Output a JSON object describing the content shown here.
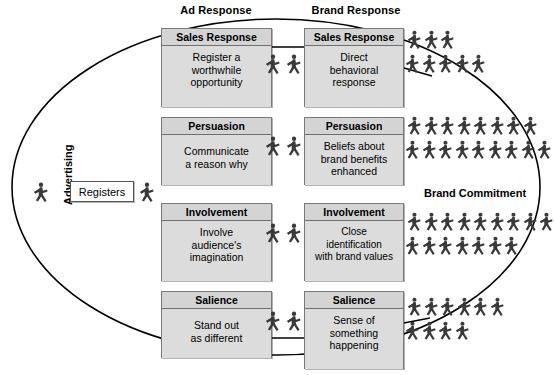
{
  "diagram": {
    "title_left_column": "Ad Response",
    "title_right_column": "Brand Response",
    "outer_label": "Advertising",
    "right_label": "Brand Commitment",
    "registers_label": "Registers",
    "figure_icon": "walking-person-icon",
    "colors": {
      "box_fill": "#dcdcdc",
      "box_header_fill": "#d4d4d4",
      "box_border": "#7a7a7a",
      "figure": "#3a3a3a",
      "line": "#000000",
      "background": "#ffffff"
    },
    "rows": [
      {
        "id": "sales-response",
        "ad": {
          "header": "Sales Response",
          "body": "Register a\nworthwhile\nopportunity"
        },
        "brand": {
          "header": "Sales Response",
          "body": "Direct\nbehavioral\nresponse"
        },
        "middle_figures": 2,
        "right_figures": [
          3,
          5
        ]
      },
      {
        "id": "persuasion",
        "ad": {
          "header": "Persuasion",
          "body": "Communicate\na reason why"
        },
        "brand": {
          "header": "Persuasion",
          "body": "Beliefs about\nbrand benefits\nenhanced"
        },
        "middle_figures": 2,
        "right_figures": [
          8,
          9
        ]
      },
      {
        "id": "involvement",
        "ad": {
          "header": "Involvement",
          "body": "Involve\naudience's\nimagination"
        },
        "brand": {
          "header": "Involvement",
          "body": "Close\nidentification\nwith brand values"
        },
        "middle_figures": 2,
        "right_figures": [
          9,
          7
        ]
      },
      {
        "id": "salience",
        "ad": {
          "header": "Salience",
          "body": "Stand out\nas different"
        },
        "brand": {
          "header": "Salience",
          "body": "Sense of\nsomething\nhappening"
        },
        "middle_figures": 2,
        "right_figures": [
          6,
          4
        ]
      }
    ],
    "left_figures": 2
  }
}
